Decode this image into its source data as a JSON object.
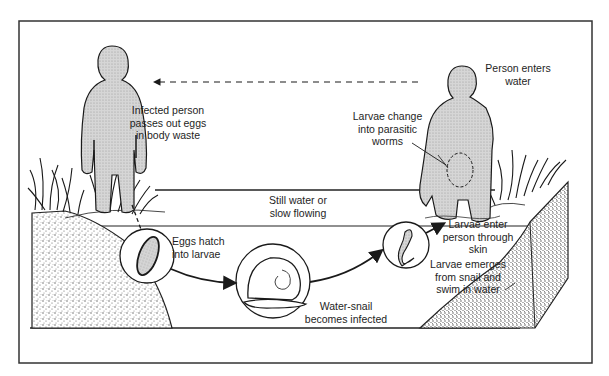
{
  "diagram": {
    "colors": {
      "ink": "#1a1a1a",
      "frame": "#333333",
      "shading": "#b8b8b8",
      "soil_stipple": "#9a9a9a",
      "background": "#ffffff"
    },
    "labels": {
      "infected_person": "Infected person\npasses out eggs\nin body waste",
      "person_enters": "Person enters\nwater",
      "larvae_change": "Larvae change\ninto parasitic\nworms",
      "still_water": "Still water or\nslow flowing",
      "eggs_hatch": "Eggs hatch\ninto larvae",
      "snail_infected": "Water-snail\nbecomes infected",
      "larvae_enter": "Larvae enter\nperson through\nskin",
      "larvae_emerge": "Larvae emerges\nfrom snail and\nswim in water"
    },
    "nodes": [
      {
        "id": "infected-person",
        "icon": "person-figure"
      },
      {
        "id": "egg",
        "icon": "egg-circle"
      },
      {
        "id": "snail",
        "icon": "snail-circle"
      },
      {
        "id": "larva",
        "icon": "larva-circle"
      },
      {
        "id": "person-entering",
        "icon": "person-wading"
      }
    ],
    "edges": [
      {
        "from": "infected-person",
        "to": "egg",
        "style": "dashed"
      },
      {
        "from": "egg",
        "to": "snail",
        "style": "solid-arrow"
      },
      {
        "from": "snail",
        "to": "larva",
        "style": "solid-arrow"
      },
      {
        "from": "larva",
        "to": "person-entering",
        "style": "solid-arrow"
      },
      {
        "from": "person-entering",
        "to": "infected-person",
        "style": "dashed-arrow"
      }
    ]
  }
}
